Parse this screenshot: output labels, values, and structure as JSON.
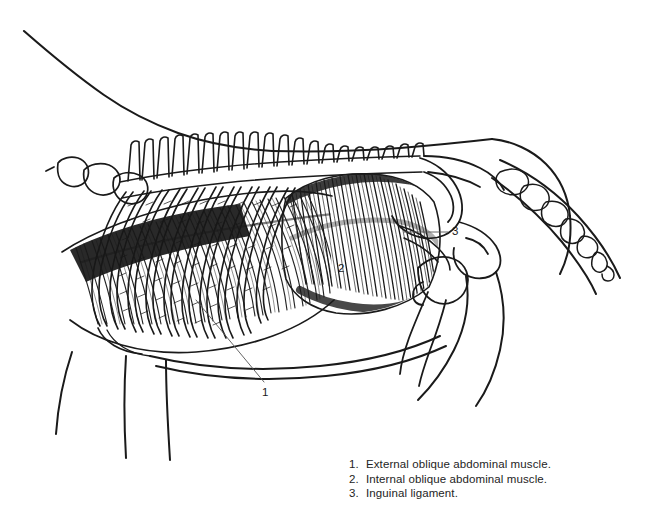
{
  "figure": {
    "background_color": "#ffffff",
    "ink_color": "#1a1a1a",
    "callouts": [
      {
        "id": "1",
        "label": "1",
        "target": "external-oblique-abdominal-muscle"
      },
      {
        "id": "2",
        "label": "2",
        "target": "internal-oblique-abdominal-muscle"
      },
      {
        "id": "3",
        "label": "3",
        "target": "inguinal-ligament"
      }
    ]
  },
  "legend": {
    "items": [
      {
        "number": "1.",
        "text": "External oblique abdominal muscle."
      },
      {
        "number": "2.",
        "text": "Internal oblique abdominal muscle."
      },
      {
        "number": "3.",
        "text": "Inguinal ligament."
      }
    ]
  }
}
